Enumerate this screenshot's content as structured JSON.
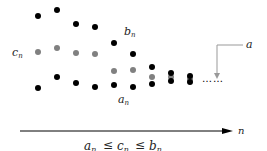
{
  "labels": {
    "b_seq": "b",
    "b_sub": "n",
    "c_seq": "c",
    "c_sub": "n",
    "a_seq": "a",
    "a_sub": "n",
    "limit": "a",
    "axis": "n",
    "inequality_a": "a",
    "inequality_c": "c",
    "inequality_b": "b",
    "inequality_sub": "n",
    "leq": "≤",
    "ellipsis": "……"
  },
  "colors": {
    "outer_dot": "#000000",
    "middle_dot": "#808080",
    "leader_line": "#999999",
    "axis": "#000000"
  },
  "sequences": {
    "b": [
      16,
      10,
      24,
      27,
      43,
      54,
      67,
      73,
      76
    ],
    "c": [
      52,
      48,
      53,
      54,
      71,
      70,
      77,
      77,
      79
    ],
    "a": [
      88,
      77,
      83,
      87,
      85,
      87,
      84,
      81,
      82
    ]
  }
}
